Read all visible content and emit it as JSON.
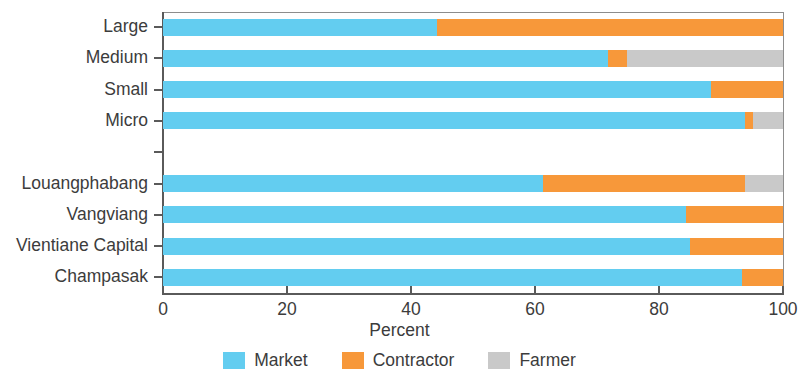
{
  "chart_data": {
    "type": "bar",
    "orientation": "horizontal",
    "stacked": true,
    "normalized": true,
    "title": "",
    "xlabel": "Percent",
    "ylabel": "",
    "xlim": [
      0,
      100
    ],
    "xticks": [
      0,
      20,
      40,
      60,
      80,
      100
    ],
    "xticklabels": [
      "0",
      "20",
      "40",
      "60",
      "80",
      "100"
    ],
    "grid": false,
    "legend_position": "bottom",
    "categories": [
      "Large",
      "Medium",
      "Small",
      "Micro",
      "",
      "Louangphabang",
      "Vangviang",
      "Vientiane Capital",
      "Champasak"
    ],
    "series": [
      {
        "name": "Market",
        "color": "#63cdf0",
        "values": [
          44.2,
          71.8,
          88.4,
          93.9,
          null,
          61.3,
          84.4,
          85.0,
          93.4
        ]
      },
      {
        "name": "Contractor",
        "color": "#f7983a",
        "values": [
          55.8,
          3.0,
          11.6,
          1.3,
          null,
          32.6,
          15.6,
          15.0,
          6.6
        ]
      },
      {
        "name": "Farmer",
        "color": "#c9c9c9",
        "values": [
          0.0,
          25.2,
          0.0,
          4.8,
          null,
          6.1,
          0.0,
          0.0,
          0.0
        ]
      }
    ],
    "legend": [
      {
        "label": "Market",
        "color": "#63cdf0",
        "swatch": "legend-swatch-market"
      },
      {
        "label": "Contractor",
        "color": "#f7983a",
        "swatch": "legend-swatch-contractor"
      },
      {
        "label": "Farmer",
        "color": "#c9c9c9",
        "swatch": "legend-swatch-farmer"
      }
    ]
  },
  "colors": {
    "market": "#63cdf0",
    "contractor": "#f7983a",
    "farmer": "#c9c9c9",
    "axis": "#5a5a5a",
    "text": "#3c3c3c",
    "background": "#ffffff"
  }
}
